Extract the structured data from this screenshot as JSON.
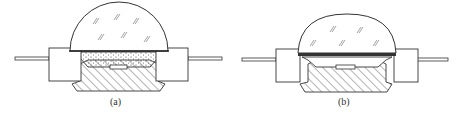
{
  "figure": {
    "panels": [
      {
        "id": "a",
        "label": "(a)",
        "description": "LED package with phosphor-filled cavity under hemispherical dome lens"
      },
      {
        "id": "b",
        "label": "(b)",
        "description": "LED package with flat phosphor layer beneath dome lens (remote phosphor)"
      }
    ]
  },
  "colors": {
    "stroke": "#333333",
    "background": "#ffffff"
  }
}
